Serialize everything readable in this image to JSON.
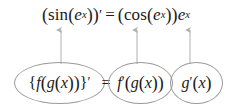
{
  "figure": {
    "kind": "chain-rule-annotated-equation",
    "background_color": "#ffffff",
    "text_color": "#1a1a1a",
    "ellipse_stroke_color": "#9a9a9a",
    "arrow_color": "#b0b0b0"
  },
  "example": {
    "full_text": "(sin(e^x))' = (cos(e^x))e^x",
    "lhs": {
      "open_paren": "(",
      "function_name": "sin",
      "inner_open": "(",
      "base": "e",
      "exponent": "x",
      "inner_close": ")",
      "close_paren": ")",
      "prime": "′"
    },
    "equals": "=",
    "rhs": {
      "outer_open": "(",
      "function_name": "cos",
      "inner_open": "(",
      "base": "e",
      "exponent": "x",
      "inner_close": ")",
      "outer_close": ")",
      "factor_base": "e",
      "factor_exponent": "x"
    }
  },
  "rule": {
    "full_text": "{f(g(x))}' = f'(g(x)) g'(x)",
    "derivative_term": {
      "open_brace": "{",
      "outer_fn": "f",
      "open_paren": "(",
      "inner_fn": "g",
      "inner_open": "(",
      "variable": "x",
      "inner_close": ")",
      "close_paren": ")",
      "close_brace": "}",
      "prime": "′"
    },
    "equals": "=",
    "outer_derivative_term": {
      "outer_fn": "f",
      "prime": "′",
      "open_paren": "(",
      "inner_fn": "g",
      "inner_open": "(",
      "variable": "x",
      "inner_close": ")",
      "close_paren": ")"
    },
    "inner_derivative_term": {
      "inner_fn": "g",
      "prime": "′",
      "open_paren": "(",
      "variable": "x",
      "close_paren": ")"
    }
  },
  "arrows": [
    {
      "name": "arrow-composite-to-example",
      "x": 61,
      "from_y": 64,
      "to_y": 30
    },
    {
      "name": "arrow-outer-derivative",
      "x": 137,
      "from_y": 64,
      "to_y": 30
    },
    {
      "name": "arrow-inner-derivative",
      "x": 190,
      "from_y": 64,
      "to_y": 30
    }
  ]
}
